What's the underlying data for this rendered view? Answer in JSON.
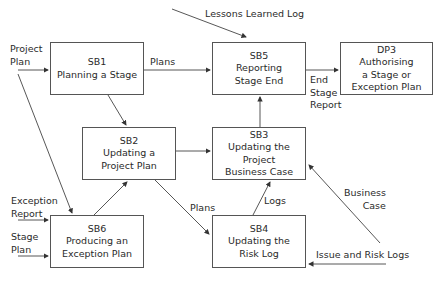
{
  "diagram": {
    "boxes": {
      "sb1": {
        "id": "SB1",
        "lines": [
          "Planning a Stage"
        ]
      },
      "sb2": {
        "id": "SB2",
        "lines": [
          "Updating a",
          "Project Plan"
        ]
      },
      "sb3": {
        "id": "SB3",
        "lines": [
          "Updating the",
          "Project",
          "Business Case"
        ]
      },
      "sb4": {
        "id": "SB4",
        "lines": [
          "Updating the",
          "Risk Log"
        ]
      },
      "sb5": {
        "id": "SB5",
        "lines": [
          "Reporting",
          "Stage End"
        ]
      },
      "sb6": {
        "id": "SB6",
        "lines": [
          "Producing an",
          "Exception Plan"
        ]
      },
      "dp3": {
        "id": "DP3",
        "lines": [
          "Authorising",
          "a Stage or",
          "Exception Plan"
        ]
      }
    },
    "labels": {
      "lessons": "Lessons Learned Log",
      "project_plan": [
        "Project",
        "Plan"
      ],
      "plans_top": "Plans",
      "end_stage_report": [
        "End",
        "Stage",
        "Report"
      ],
      "exception_report": [
        "Exception",
        "Report"
      ],
      "stage_plan": [
        "Stage",
        "Plan"
      ],
      "plans_mid": "Plans",
      "logs": "Logs",
      "business_case": [
        "Business",
        "Case"
      ],
      "issue_risk": "Issue and Risk Logs"
    }
  }
}
